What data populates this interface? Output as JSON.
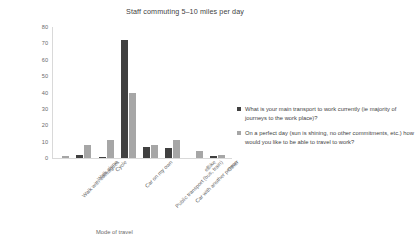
{
  "chart_data": {
    "type": "bar",
    "title": "Staff commuting 5–10 miles per day",
    "xlabel": "Mode of travel",
    "ylabel": "Number of staff",
    "ylim": [
      0,
      80
    ],
    "yticks": [
      0,
      10,
      20,
      30,
      40,
      50,
      60,
      70,
      80
    ],
    "grid": false,
    "legend_position": "right",
    "categories": [
      "Walk with colleagues",
      "Walk alone",
      "Cycle",
      "Car on my own",
      "Public transport (bus, train)",
      "Car with another person",
      "eBike",
      "Other"
    ],
    "series": [
      {
        "name": "What is your main transport to work currently (ie majority of journeys to the work place)?",
        "color": "#404040",
        "values": [
          0,
          2,
          0.5,
          72,
          7,
          6,
          0,
          1
        ]
      },
      {
        "name": "On a perfect day (sun is shining, no other commitments, etc.) how would you like to be able to travel to work?",
        "color": "#A6A6A6",
        "values": [
          1,
          8,
          11,
          40,
          8,
          11,
          4,
          2
        ]
      }
    ]
  },
  "legend": {
    "items": [
      {
        "label": "What is your main transport to work currently (ie majority of journeys to the work place)?",
        "color": "#404040"
      },
      {
        "label": "On a perfect day (sun is shining, no other commitments, etc.) how would you like to be able to travel to work?",
        "color": "#A6A6A6"
      }
    ]
  }
}
